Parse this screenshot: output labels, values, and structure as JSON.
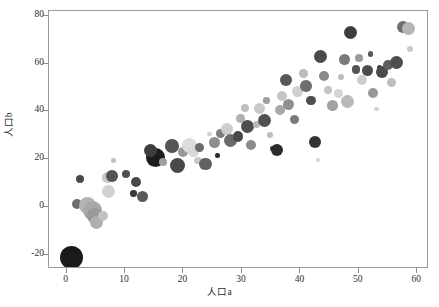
{
  "chart_data": {
    "type": "scatter",
    "title": "",
    "xlabel": "人口a",
    "ylabel": "人口b",
    "xlim": [
      -3,
      62
    ],
    "ylim": [
      -26,
      82
    ],
    "xticks": [
      0,
      10,
      20,
      30,
      40,
      50,
      60
    ],
    "yticks": [
      -20,
      0,
      20,
      40,
      60,
      80
    ],
    "xtick_labels": [
      "0",
      "10",
      "20",
      "30",
      "40",
      "50",
      "60"
    ],
    "ytick_labels": [
      "-20",
      "0",
      "20",
      "40",
      "60",
      "80"
    ],
    "grid": false,
    "legend": null,
    "marker": "circle",
    "colormap": "grayscale",
    "size_encoding": "bubble-radius",
    "points": [
      {
        "x": 0.8,
        "y": -21.0,
        "r": 11.5,
        "c": "#1a1a1a"
      },
      {
        "x": 1.8,
        "y": 1.2,
        "r": 5.0,
        "c": "#6e6e6e"
      },
      {
        "x": 3.6,
        "y": 0.5,
        "r": 8.5,
        "c": "#b4b4b4"
      },
      {
        "x": 4.4,
        "y": -1.5,
        "r": 9.5,
        "c": "#a8a8a8"
      },
      {
        "x": 4.9,
        "y": -3.8,
        "r": 8.0,
        "c": "#9a9a9a"
      },
      {
        "x": 5.2,
        "y": -6.5,
        "r": 6.5,
        "c": "#b0b0b0"
      },
      {
        "x": 6.2,
        "y": -4.0,
        "r": 5.0,
        "c": "#c2c2c2"
      },
      {
        "x": 2.3,
        "y": 11.8,
        "r": 4.2,
        "c": "#4a4a4a"
      },
      {
        "x": 7.0,
        "y": 12.5,
        "r": 5.5,
        "c": "#c8c8c8"
      },
      {
        "x": 7.8,
        "y": 13.0,
        "r": 5.8,
        "c": "#555555"
      },
      {
        "x": 7.2,
        "y": 6.5,
        "r": 6.5,
        "c": "#d2d2d2"
      },
      {
        "x": 8.0,
        "y": 19.5,
        "r": 2.3,
        "c": "#c0c0c0"
      },
      {
        "x": 10.2,
        "y": 13.8,
        "r": 4.2,
        "c": "#4f4f4f"
      },
      {
        "x": 11.8,
        "y": 10.3,
        "r": 5.0,
        "c": "#484848"
      },
      {
        "x": 11.5,
        "y": 5.5,
        "r": 3.3,
        "c": "#3b3b3b"
      },
      {
        "x": 13.0,
        "y": 4.2,
        "r": 5.5,
        "c": "#5a5a5a"
      },
      {
        "x": 15.2,
        "y": 20.5,
        "r": 9.5,
        "c": "#1c1c1c"
      },
      {
        "x": 14.3,
        "y": 23.5,
        "r": 6.5,
        "c": "#3e3e3e"
      },
      {
        "x": 16.5,
        "y": 18.6,
        "r": 4.0,
        "c": "#a0a0a0"
      },
      {
        "x": 19.0,
        "y": 17.5,
        "r": 7.5,
        "c": "#4a4a4a"
      },
      {
        "x": 18.0,
        "y": 25.5,
        "r": 6.8,
        "c": "#555555"
      },
      {
        "x": 20.0,
        "y": 23.0,
        "r": 5.0,
        "c": "#989898"
      },
      {
        "x": 21.0,
        "y": 25.5,
        "r": 7.5,
        "c": "#dcdcdc"
      },
      {
        "x": 21.8,
        "y": 23.2,
        "r": 5.5,
        "c": "#d8d8d8"
      },
      {
        "x": 22.8,
        "y": 24.8,
        "r": 4.5,
        "c": "#6a6a6a"
      },
      {
        "x": 22.5,
        "y": 19.5,
        "r": 3.8,
        "c": "#c8c8c8"
      },
      {
        "x": 23.8,
        "y": 18.0,
        "r": 6.2,
        "c": "#616161"
      },
      {
        "x": 24.5,
        "y": 30.5,
        "r": 2.4,
        "c": "#cfcfcf"
      },
      {
        "x": 25.3,
        "y": 27.0,
        "r": 5.5,
        "c": "#8e8e8e"
      },
      {
        "x": 25.8,
        "y": 21.5,
        "r": 2.2,
        "c": "#2a2a2a"
      },
      {
        "x": 26.3,
        "y": 30.8,
        "r": 4.4,
        "c": "#7d7d7d"
      },
      {
        "x": 27.5,
        "y": 32.5,
        "r": 6.0,
        "c": "#cdcdcd"
      },
      {
        "x": 28.0,
        "y": 28.0,
        "r": 6.5,
        "c": "#6a6a6a"
      },
      {
        "x": 29.3,
        "y": 29.5,
        "r": 5.2,
        "c": "#4a4a4a"
      },
      {
        "x": 29.8,
        "y": 37.0,
        "r": 4.3,
        "c": "#b0b0b0"
      },
      {
        "x": 30.5,
        "y": 41.5,
        "r": 4.0,
        "c": "#c0c0c0"
      },
      {
        "x": 31.0,
        "y": 33.5,
        "r": 6.5,
        "c": "#4e4e4e"
      },
      {
        "x": 31.6,
        "y": 26.0,
        "r": 5.0,
        "c": "#8c8c8c"
      },
      {
        "x": 32.5,
        "y": 34.5,
        "r": 3.6,
        "c": "#b8b8b8"
      },
      {
        "x": 33.0,
        "y": 41.0,
        "r": 5.5,
        "c": "#cacaca"
      },
      {
        "x": 33.8,
        "y": 36.0,
        "r": 6.5,
        "c": "#515151"
      },
      {
        "x": 34.2,
        "y": 44.5,
        "r": 3.2,
        "c": "#9e9e9e"
      },
      {
        "x": 34.8,
        "y": 30.0,
        "r": 3.0,
        "c": "#bdbdbd"
      },
      {
        "x": 35.2,
        "y": 24.5,
        "r": 2.2,
        "c": "#3a3a3a"
      },
      {
        "x": 36.0,
        "y": 23.8,
        "r": 6.3,
        "c": "#2c2c2c"
      },
      {
        "x": 36.5,
        "y": 40.5,
        "r": 5.0,
        "c": "#a8a8a8"
      },
      {
        "x": 36.8,
        "y": 46.5,
        "r": 5.0,
        "c": "#c6c6c6"
      },
      {
        "x": 37.5,
        "y": 53.0,
        "r": 6.0,
        "c": "#585858"
      },
      {
        "x": 38.0,
        "y": 43.0,
        "r": 5.5,
        "c": "#909090"
      },
      {
        "x": 39.0,
        "y": 36.5,
        "r": 4.6,
        "c": "#7a7a7a"
      },
      {
        "x": 39.5,
        "y": 48.5,
        "r": 5.5,
        "c": "#d0d0d0"
      },
      {
        "x": 40.5,
        "y": 56.0,
        "r": 4.4,
        "c": "#bcbcbc"
      },
      {
        "x": 41.0,
        "y": 50.5,
        "r": 5.8,
        "c": "#6e6e6e"
      },
      {
        "x": 41.8,
        "y": 44.5,
        "r": 4.8,
        "c": "#4f4f4f"
      },
      {
        "x": 42.5,
        "y": 27.0,
        "r": 6.0,
        "c": "#333333"
      },
      {
        "x": 43.0,
        "y": 19.5,
        "r": 2.0,
        "c": "#cfcfcf"
      },
      {
        "x": 43.5,
        "y": 63.0,
        "r": 6.5,
        "c": "#4a4a4a"
      },
      {
        "x": 44.0,
        "y": 55.0,
        "r": 5.0,
        "c": "#8a8a8a"
      },
      {
        "x": 44.8,
        "y": 49.0,
        "r": 4.0,
        "c": "#c4c4c4"
      },
      {
        "x": 45.5,
        "y": 42.5,
        "r": 5.3,
        "c": "#a2a2a2"
      },
      {
        "x": 46.5,
        "y": 47.5,
        "r": 4.6,
        "c": "#d4d4d4"
      },
      {
        "x": 47.0,
        "y": 54.5,
        "r": 3.0,
        "c": "#bebebe"
      },
      {
        "x": 47.5,
        "y": 61.5,
        "r": 5.5,
        "c": "#7a7a7a"
      },
      {
        "x": 48.0,
        "y": 44.0,
        "r": 6.5,
        "c": "#bababa"
      },
      {
        "x": 48.5,
        "y": 73.0,
        "r": 6.5,
        "c": "#3e3e3e"
      },
      {
        "x": 49.5,
        "y": 57.5,
        "r": 4.2,
        "c": "#555555"
      },
      {
        "x": 50.0,
        "y": 62.5,
        "r": 4.0,
        "c": "#9b9b9b"
      },
      {
        "x": 50.5,
        "y": 53.0,
        "r": 5.0,
        "c": "#cdcdcd"
      },
      {
        "x": 51.5,
        "y": 57.0,
        "r": 5.6,
        "c": "#4c4c4c"
      },
      {
        "x": 52.0,
        "y": 64.0,
        "r": 2.6,
        "c": "#5a5a5a"
      },
      {
        "x": 52.5,
        "y": 47.5,
        "r": 5.0,
        "c": "#989898"
      },
      {
        "x": 53.0,
        "y": 41.0,
        "r": 2.3,
        "c": "#d2d2d2"
      },
      {
        "x": 53.5,
        "y": 58.5,
        "r": 2.5,
        "c": "#3d3d3d"
      },
      {
        "x": 54.0,
        "y": 56.5,
        "r": 6.0,
        "c": "#4a4a4a"
      },
      {
        "x": 55.0,
        "y": 59.5,
        "r": 5.2,
        "c": "#5e5e5e"
      },
      {
        "x": 55.5,
        "y": 52.0,
        "r": 4.5,
        "c": "#bfbfbf"
      },
      {
        "x": 56.5,
        "y": 60.5,
        "r": 6.5,
        "c": "#4e4e4e"
      },
      {
        "x": 57.5,
        "y": 75.5,
        "r": 6.0,
        "c": "#6f6f6f"
      },
      {
        "x": 58.5,
        "y": 74.5,
        "r": 6.5,
        "c": "#b6b6b6"
      },
      {
        "x": 58.8,
        "y": 66.0,
        "r": 3.2,
        "c": "#c8c8c8"
      }
    ]
  },
  "axes": {
    "x_title": "人口a",
    "y_title": "人口b",
    "x_labels": [
      "0",
      "10",
      "20",
      "30",
      "40",
      "50",
      "60"
    ],
    "y_labels": [
      "80",
      "60",
      "40",
      "20",
      "0",
      "-20"
    ]
  },
  "style": {
    "frame_color": "#9a9a9a",
    "tick_color": "#8c8c8c",
    "text_color": "#2b2b2b",
    "background": "#ffffff"
  }
}
